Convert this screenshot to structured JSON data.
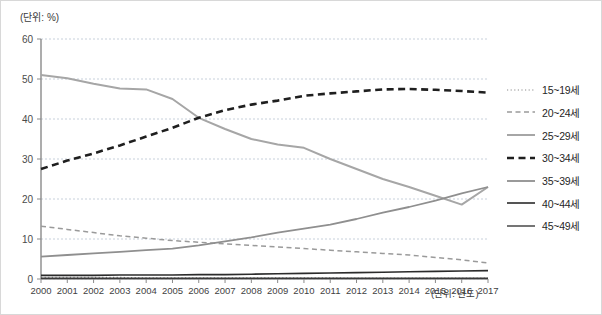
{
  "figure": {
    "unit_y_label": "(단위: %)",
    "unit_x_label": "(단위: 년도)"
  },
  "chart_data": {
    "type": "line",
    "title": "",
    "xlabel": "(단위: 년도)",
    "ylabel": "(단위: %)",
    "xlim": [
      2000,
      2017
    ],
    "ylim": [
      0,
      60
    ],
    "yticks": [
      0,
      10,
      20,
      30,
      40,
      50,
      60
    ],
    "grid": true,
    "legend_position": "right",
    "categories": [
      "2000",
      "2001",
      "2002",
      "2003",
      "2004",
      "2005",
      "2006",
      "2007",
      "2008",
      "2009",
      "2010",
      "2011",
      "2012",
      "2013",
      "2014",
      "2015",
      "2016",
      "2017"
    ],
    "series": [
      {
        "name": "15~19세",
        "style": "dotted",
        "color": "#8c8c8c",
        "width": 1.2,
        "values": [
          0.4,
          0.4,
          0.4,
          0.4,
          0.3,
          0.3,
          0.3,
          0.3,
          0.3,
          0.3,
          0.3,
          0.3,
          0.2,
          0.2,
          0.2,
          0.2,
          0.2,
          0.2
        ]
      },
      {
        "name": "20~24세",
        "style": "dashed",
        "color": "#9a9a9a",
        "width": 1.5,
        "values": [
          13.2,
          12.4,
          11.6,
          10.8,
          10.2,
          9.6,
          9.2,
          8.8,
          8.4,
          8.0,
          7.6,
          7.2,
          6.8,
          6.4,
          6.0,
          5.4,
          4.8,
          4.0
        ]
      },
      {
        "name": "25~29세",
        "style": "solid",
        "color": "#a6a6a6",
        "width": 2.0,
        "values": [
          51.0,
          50.2,
          48.8,
          47.6,
          47.4,
          45.0,
          40.3,
          37.5,
          35.0,
          33.6,
          32.8,
          30.0,
          27.5,
          25.0,
          23.0,
          20.8,
          18.6,
          23.0
        ]
      },
      {
        "name": "30~34세",
        "style": "bold-dashed",
        "color": "#1f1f1f",
        "width": 2.6,
        "values": [
          27.5,
          29.6,
          31.4,
          33.4,
          35.6,
          37.8,
          40.3,
          42.2,
          43.6,
          44.6,
          45.8,
          46.4,
          46.9,
          47.4,
          47.5,
          47.3,
          47.0,
          46.6
        ]
      },
      {
        "name": "35~39세",
        "style": "solid",
        "color": "#8f8f8f",
        "width": 1.8,
        "values": [
          5.6,
          6.0,
          6.4,
          6.8,
          7.2,
          7.6,
          8.4,
          9.4,
          10.4,
          11.6,
          12.6,
          13.6,
          15.0,
          16.6,
          18.0,
          19.6,
          21.4,
          23.0
        ]
      },
      {
        "name": "40~44세",
        "style": "solid-dark",
        "color": "#2b2b2b",
        "width": 1.6,
        "values": [
          0.9,
          0.9,
          0.9,
          1.0,
          1.0,
          1.0,
          1.1,
          1.1,
          1.2,
          1.3,
          1.4,
          1.5,
          1.6,
          1.7,
          1.8,
          1.9,
          2.0,
          2.1
        ]
      },
      {
        "name": "45~49세",
        "style": "solid-dark",
        "color": "#3a3a3a",
        "width": 1.4,
        "values": [
          0.2,
          0.2,
          0.2,
          0.2,
          0.2,
          0.2,
          0.2,
          0.2,
          0.2,
          0.2,
          0.2,
          0.2,
          0.2,
          0.2,
          0.2,
          0.2,
          0.2,
          0.2
        ]
      }
    ]
  }
}
